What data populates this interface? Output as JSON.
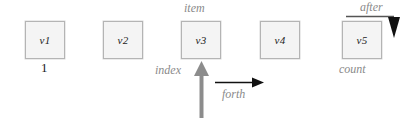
{
  "diagram": {
    "colors": {
      "cell_fill": "#f4f4f4",
      "cell_border": "#b4b4b4",
      "annotation_gray": "#8a8a8a",
      "arrow_gray": "#8c8c8c",
      "arrow_black": "#111111",
      "text_black": "#1a1a1a",
      "background": "#ffffff"
    },
    "cells": [
      {
        "label": "v1",
        "x": 25,
        "y": 21
      },
      {
        "label": "v2",
        "x": 103,
        "y": 21
      },
      {
        "label": "v3",
        "x": 181,
        "y": 21
      },
      {
        "label": "v4",
        "x": 260,
        "y": 21
      },
      {
        "label": "v5",
        "x": 342,
        "y": 21
      }
    ],
    "annotations": {
      "first_index": "1",
      "item": "item",
      "index": "index",
      "forth": "forth",
      "after": "after",
      "count": "count"
    }
  }
}
